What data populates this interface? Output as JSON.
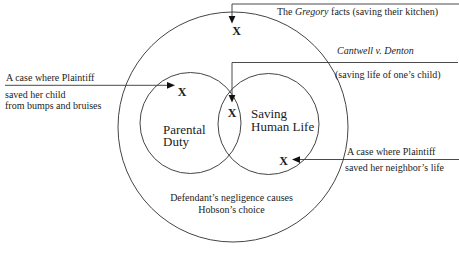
{
  "diagram": {
    "outer_circle_label_line1": "Defendant’s negligence causes",
    "outer_circle_label_line2": "Hobson’s choice",
    "left_circle_label": "Parental Duty",
    "right_circle_label": "Saving Human Life",
    "x_marker_glyph": "X"
  },
  "annotations": {
    "gregory": {
      "prefix": "The ",
      "case_name": "Gregory",
      "suffix": " facts (saving their kitchen)"
    },
    "cantwell": {
      "case_name": "Cantwell v. Denton",
      "detail": "(saving life of one’s child)"
    },
    "left_case": {
      "line1": "A case where Plaintiff",
      "line2": "saved her child",
      "line3": "from bumps and bruises"
    },
    "right_case": {
      "line1": "A case where Plaintiff",
      "line2": "saved her neighbor’s life"
    }
  },
  "colors": {
    "line": "#353535",
    "circle_stroke": "#454545",
    "text": "#1c1c1c",
    "arrowhead": "#111111",
    "background": "#ffffff"
  }
}
